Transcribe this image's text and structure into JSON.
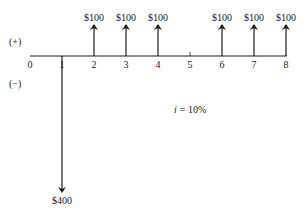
{
  "diagram": {
    "type": "cash-flow-diagram",
    "positive_label": "(+)",
    "negative_label": "(−)",
    "interest_rate_label": "i = 10%",
    "interest_rate_symbol": "i",
    "interest_rate_value": "= 10%",
    "periods": [
      "0",
      "1",
      "2",
      "3",
      "4",
      "5",
      "6",
      "7",
      "8"
    ],
    "cash_flows": [
      {
        "period": 1,
        "direction": "down",
        "amount": -400,
        "label": "$400"
      },
      {
        "period": 2,
        "direction": "up",
        "amount": 100,
        "label": "$100"
      },
      {
        "period": 3,
        "direction": "up",
        "amount": 100,
        "label": "$100"
      },
      {
        "period": 4,
        "direction": "up",
        "amount": 100,
        "label": "$100"
      },
      {
        "period": 6,
        "direction": "up",
        "amount": 100,
        "label": "$100"
      },
      {
        "period": 7,
        "direction": "up",
        "amount": 100,
        "label": "$100"
      },
      {
        "period": 8,
        "direction": "up",
        "amount": 100,
        "label": "$100"
      }
    ],
    "colors": {
      "line": "#1a1a1a",
      "background": "#ffffff"
    }
  }
}
